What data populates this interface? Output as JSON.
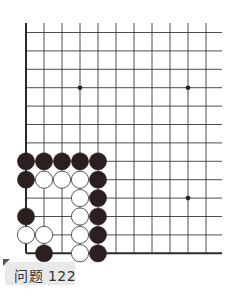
{
  "problem": {
    "label": "问题 122",
    "label_bg": "#e9e9e9"
  },
  "board": {
    "line_color": "#3a3a3a",
    "edge_color": "#2a2a2a",
    "black_color": "#2b1f1f",
    "white_color": "#ffffff",
    "origin_x": 26,
    "origin_y": 32.5,
    "spacing_x": 18,
    "spacing_y": 18.4,
    "cols": 11,
    "rows": 13,
    "line_right_end": 222,
    "line_top_start": 23,
    "visible_edges": [
      "left",
      "bottom"
    ],
    "star_points": [
      {
        "col": 3,
        "row": 3
      },
      {
        "col": 9,
        "row": 3
      },
      {
        "col": 9,
        "row": 9
      }
    ],
    "stones": [
      {
        "col": 0,
        "row": 7,
        "color": "black"
      },
      {
        "col": 1,
        "row": 7,
        "color": "black"
      },
      {
        "col": 2,
        "row": 7,
        "color": "black"
      },
      {
        "col": 3,
        "row": 7,
        "color": "black"
      },
      {
        "col": 4,
        "row": 7,
        "color": "black"
      },
      {
        "col": 0,
        "row": 8,
        "color": "black"
      },
      {
        "col": 1,
        "row": 8,
        "color": "white"
      },
      {
        "col": 2,
        "row": 8,
        "color": "white"
      },
      {
        "col": 3,
        "row": 8,
        "color": "white"
      },
      {
        "col": 4,
        "row": 8,
        "color": "black"
      },
      {
        "col": 3,
        "row": 9,
        "color": "white"
      },
      {
        "col": 4,
        "row": 9,
        "color": "black"
      },
      {
        "col": 0,
        "row": 10,
        "color": "black"
      },
      {
        "col": 3,
        "row": 10,
        "color": "white"
      },
      {
        "col": 4,
        "row": 10,
        "color": "black"
      },
      {
        "col": 0,
        "row": 11,
        "color": "white"
      },
      {
        "col": 1,
        "row": 11,
        "color": "white"
      },
      {
        "col": 3,
        "row": 11,
        "color": "white"
      },
      {
        "col": 4,
        "row": 11,
        "color": "black"
      },
      {
        "col": 1,
        "row": 12,
        "color": "black"
      },
      {
        "col": 3,
        "row": 12,
        "color": "white"
      },
      {
        "col": 4,
        "row": 12,
        "color": "black"
      }
    ]
  }
}
